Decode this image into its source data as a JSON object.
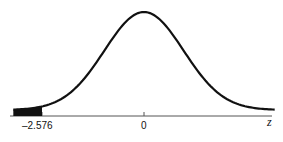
{
  "chart_data": {
    "type": "line",
    "title": "",
    "xlabel": "z",
    "ylabel": "",
    "mean": 0,
    "sd": 1,
    "x_ticks": [
      {
        "value": -2.576,
        "label": "–2.576"
      },
      {
        "value": 0,
        "label": "0"
      }
    ],
    "shaded_region": {
      "from": "-inf",
      "to": -2.576,
      "tail": "left"
    },
    "xlim": [
      -3.3,
      3.3
    ],
    "grid": false,
    "legend": false
  },
  "labels": {
    "tick_neg": "–2.576",
    "tick_zero": "0",
    "axis_var": "z"
  },
  "colors": {
    "curve": "#111111",
    "axis": "#555555",
    "shade": "#111111"
  }
}
